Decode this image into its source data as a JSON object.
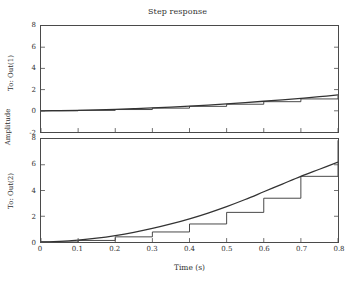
{
  "chart_data": {
    "type": "line",
    "title": "Step response",
    "xlabel": "Time (s)",
    "ylabel": "Amplitude",
    "grid": false,
    "legend": null,
    "xlim": [
      0,
      0.8
    ],
    "xticks": [
      "0",
      "0.1",
      "0.2",
      "0.3",
      "0.4",
      "0.5",
      "0.6",
      "0.7",
      "0.8"
    ],
    "xtick_values": [
      0,
      0.1,
      0.2,
      0.3,
      0.4,
      0.5,
      0.6,
      0.7,
      0.8
    ],
    "line_color": "#333333",
    "axis_color": "#4a4a4a",
    "subplots": [
      {
        "name": "To: Out(1)",
        "ylabel": "To: Out(1)",
        "ylim": [
          -2,
          8
        ],
        "yticks": [
          "8",
          "6",
          "4",
          "2",
          "0",
          "-2"
        ],
        "ytick_values": [
          8,
          6,
          4,
          2,
          0,
          -2
        ],
        "series": [
          {
            "name": "continuous",
            "style": "smooth",
            "x": [
              0,
              0.05,
              0.1,
              0.15,
              0.2,
              0.25,
              0.3,
              0.35,
              0.4,
              0.45,
              0.5,
              0.55,
              0.6,
              0.65,
              0.7,
              0.75,
              0.8
            ],
            "values": [
              0.0,
              0.02,
              0.05,
              0.09,
              0.14,
              0.2,
              0.27,
              0.35,
              0.44,
              0.54,
              0.65,
              0.77,
              0.9,
              1.04,
              1.18,
              1.33,
              1.5
            ]
          },
          {
            "name": "zero-order-hold",
            "style": "staircase",
            "x": [
              0,
              0.1,
              0.2,
              0.3,
              0.4,
              0.5,
              0.6,
              0.7,
              0.8
            ],
            "values": [
              0.0,
              0.04,
              0.12,
              0.25,
              0.42,
              0.62,
              0.86,
              1.12,
              1.45
            ]
          }
        ]
      },
      {
        "name": "To: Out(2)",
        "ylabel": "To: Out(2)",
        "ylim": [
          0,
          8
        ],
        "yticks": [
          "8",
          "6",
          "4",
          "2",
          "0"
        ],
        "ytick_values": [
          8,
          6,
          4,
          2,
          0
        ],
        "series": [
          {
            "name": "continuous",
            "style": "smooth",
            "x": [
              0,
              0.05,
              0.1,
              0.15,
              0.2,
              0.25,
              0.3,
              0.35,
              0.4,
              0.45,
              0.5,
              0.55,
              0.6,
              0.65,
              0.7,
              0.75,
              0.8
            ],
            "values": [
              0.0,
              0.05,
              0.15,
              0.3,
              0.5,
              0.75,
              1.05,
              1.4,
              1.8,
              2.25,
              2.75,
              3.3,
              3.9,
              4.5,
              5.1,
              5.65,
              6.2
            ]
          },
          {
            "name": "zero-order-hold",
            "style": "staircase",
            "x": [
              0,
              0.1,
              0.2,
              0.3,
              0.4,
              0.5,
              0.6,
              0.7,
              0.8
            ],
            "values": [
              0.0,
              0.12,
              0.4,
              0.78,
              1.4,
              2.3,
              3.4,
              5.1,
              7.9
            ]
          }
        ]
      }
    ]
  }
}
